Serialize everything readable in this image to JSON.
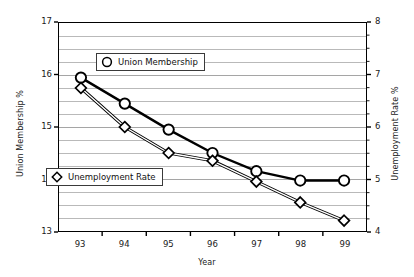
{
  "chart_data": {
    "type": "line",
    "title": "",
    "xlabel": "Year",
    "categories": [
      "93",
      "94",
      "95",
      "96",
      "97",
      "98",
      "99"
    ],
    "grid": true,
    "legend_position": "inside-plot",
    "axes": {
      "left": {
        "label": "Union Membership %",
        "ylim": [
          13,
          17
        ],
        "ticks": [
          13,
          14,
          15,
          16,
          17
        ],
        "tick_labels": [
          "13",
          "14",
          "15",
          "16",
          "17"
        ],
        "minor_step": 0.25
      },
      "right": {
        "label": "Unemployment Rate %",
        "ylim": [
          4,
          8
        ],
        "ticks": [
          4,
          5,
          6,
          7,
          8
        ],
        "tick_labels": [
          "4",
          "5",
          "6",
          "7",
          "8"
        ],
        "minor_step": 0.25
      }
    },
    "series": [
      {
        "name": "Union Membership",
        "axis": "left",
        "marker": "circle",
        "color": "#000000",
        "values": [
          15.95,
          15.45,
          14.95,
          14.5,
          14.15,
          13.97,
          13.97
        ]
      },
      {
        "name": "Unemployment Rate",
        "axis": "right",
        "marker": "diamond",
        "color": "#000000",
        "values": [
          6.75,
          6.0,
          5.5,
          5.35,
          4.95,
          4.55,
          4.2
        ]
      }
    ]
  },
  "legend": {
    "union": {
      "label": "Union Membership",
      "marker": "circle-marker-icon"
    },
    "unemployment": {
      "label": "Unemployment Rate",
      "marker": "diamond-marker-icon"
    }
  },
  "colors": {
    "axis": "#000000",
    "grid": "#9a9a9a",
    "text": "#1a1a1a",
    "background": "#ffffff"
  }
}
